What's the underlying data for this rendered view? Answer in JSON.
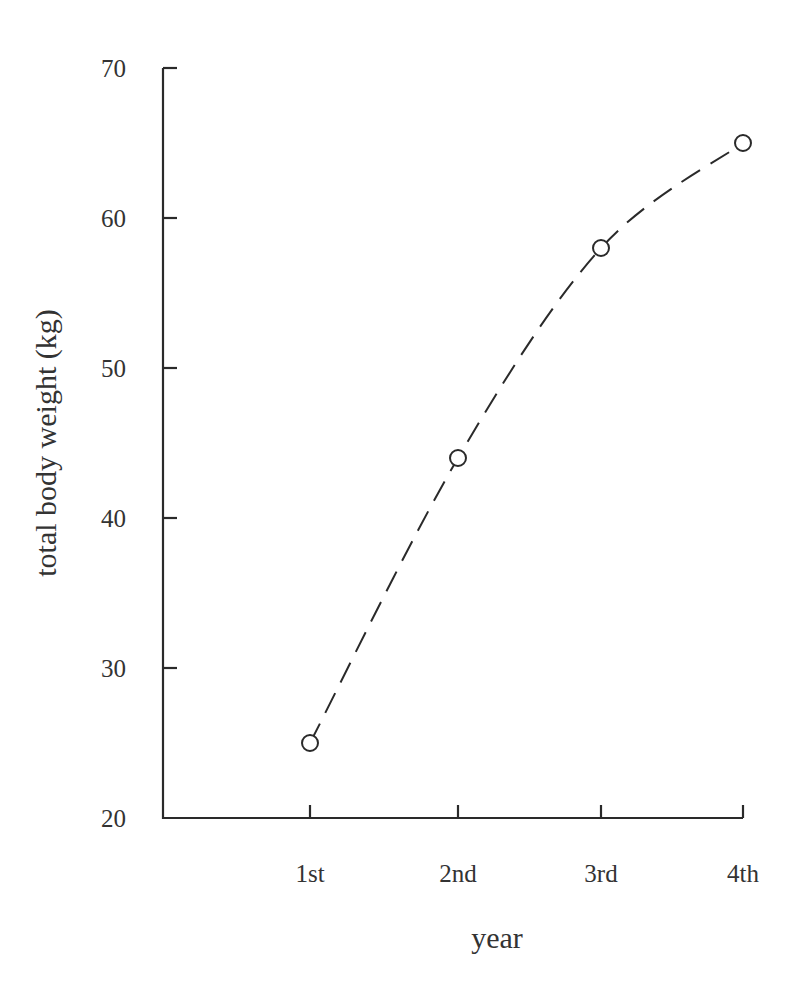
{
  "chart_data": {
    "type": "line",
    "title": "",
    "xlabel": "year",
    "ylabel": "total body weight (kg)",
    "categories": [
      "1st",
      "2nd",
      "3rd",
      "4th"
    ],
    "series": [
      {
        "name": "total body weight",
        "values": [
          25,
          44,
          58,
          65
        ],
        "line_style": "dashed",
        "marker": "open-circle"
      }
    ],
    "ylim": [
      20,
      70
    ],
    "yticks": [
      20,
      30,
      40,
      50,
      60,
      70
    ],
    "grid": false,
    "legend": null
  },
  "axes": {
    "x_label": "year",
    "y_label": "total body weight (kg)"
  }
}
